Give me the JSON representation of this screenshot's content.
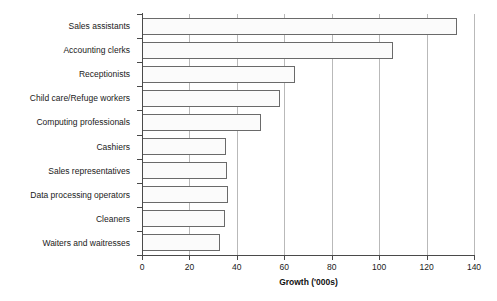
{
  "chart_data": {
    "type": "bar",
    "orientation": "horizontal",
    "title": "",
    "xlabel": "Growth ('000s)",
    "ylabel": "",
    "xlim": [
      0,
      140
    ],
    "xticks": [
      0,
      20,
      40,
      60,
      80,
      100,
      120,
      140
    ],
    "grid": true,
    "legend": false,
    "categories": [
      "Sales assistants",
      "Accounting clerks",
      "Receptionists",
      "Child care/Refuge workers",
      "Computing professionals",
      "Cashiers",
      "Sales representatives",
      "Data processing operators",
      "Cleaners",
      "Waiters and waitresses"
    ],
    "values": [
      133,
      106,
      64.5,
      58,
      50,
      35.5,
      36,
      36.4,
      34.8,
      33
    ],
    "bar_fill_color": "#fbfbfb",
    "bar_border_color": "#6a6a6a",
    "gridline_color": "#b9b9b9",
    "axis_color": "#4a4a4a"
  }
}
